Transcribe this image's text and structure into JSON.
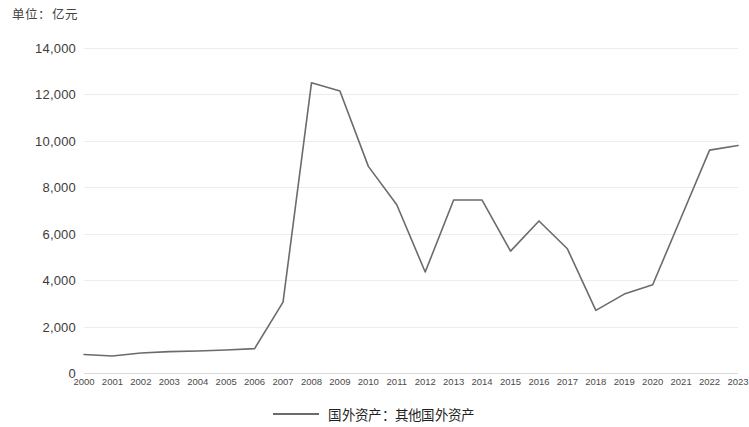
{
  "unit_caption": "单位：亿元",
  "legend": {
    "series_label": "国外资产：其他国外资产",
    "line_color": "#6b6b6b"
  },
  "chart_data": {
    "type": "line",
    "title": "",
    "subtitle": "",
    "xlabel": "",
    "ylabel": "",
    "unit": "亿元",
    "grid": true,
    "legend_position": "bottom",
    "ylim": [
      0,
      14000
    ],
    "ytick_step": 2000,
    "ytick_labels": [
      "14,000",
      "12,000",
      "10,000",
      "8,000",
      "6,000",
      "4,000",
      "2,000",
      "0"
    ],
    "ytick_values": [
      14000,
      12000,
      10000,
      8000,
      6000,
      4000,
      2000,
      0
    ],
    "categories": [
      "2000",
      "2001",
      "2002",
      "2003",
      "2004",
      "2005",
      "2006",
      "2007",
      "2008",
      "2009",
      "2010",
      "2011",
      "2012",
      "2013",
      "2014",
      "2015",
      "2016",
      "2017",
      "2018",
      "2019",
      "2020",
      "2021",
      "2022",
      "2023"
    ],
    "series": [
      {
        "name": "国外资产：其他国外资产",
        "color": "#6b6b6b",
        "values": [
          800,
          730,
          860,
          920,
          950,
          990,
          1050,
          3050,
          12500,
          12150,
          8900,
          7250,
          4350,
          7450,
          7450,
          5250,
          6550,
          5350,
          2700,
          3400,
          3800,
          6700,
          9600,
          9800
        ]
      }
    ]
  }
}
